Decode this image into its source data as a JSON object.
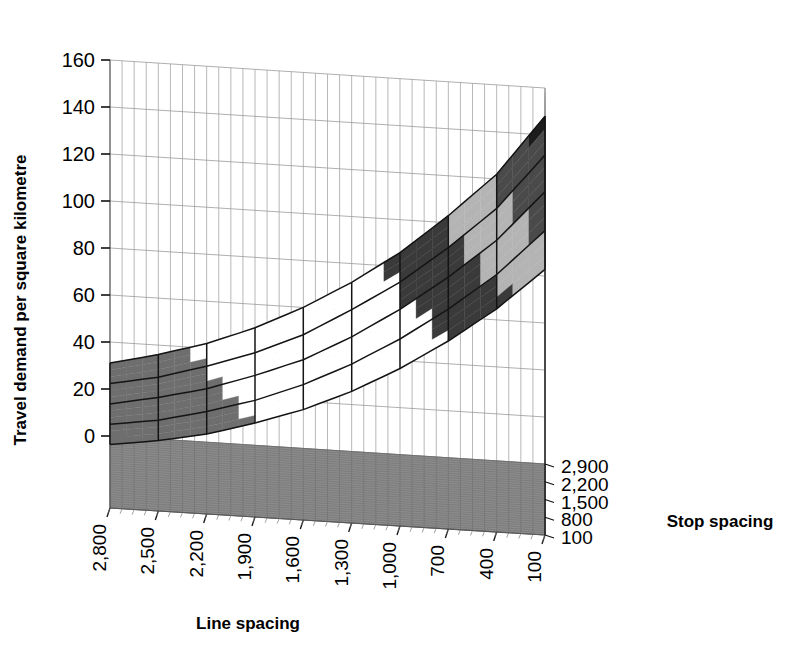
{
  "chart_data": {
    "type": "surface",
    "title": "",
    "xlabel": "Line spacing",
    "zlabel": "Stop spacing",
    "ylabel": "Travel demand per square kilometre",
    "x_categories": [
      "2,800",
      "2,500",
      "2,200",
      "1,900",
      "1,600",
      "1,300",
      "1,000",
      "700",
      "400",
      "100"
    ],
    "z_categories": [
      "2,900",
      "2,200",
      "1,500",
      "800",
      "100"
    ],
    "y_ticks": [
      0,
      20,
      40,
      60,
      80,
      100,
      120,
      140,
      160
    ],
    "ylim": [
      0,
      160
    ],
    "grid": true,
    "legend": "none",
    "band_boundaries": [
      0,
      20,
      40,
      60,
      80,
      100,
      120,
      140,
      160
    ],
    "band_colors": [
      "#d8d8d8",
      "#6e6e6e",
      "#ffffff",
      "#ffffff",
      "#3a3a3a",
      "#b4b4b4",
      "#4a4a4a",
      "#1c1c1c"
    ],
    "series": [
      {
        "name": "2,900",
        "values": [
          31,
          36,
          42,
          50,
          60,
          72,
          86,
          103,
          122,
          148
        ]
      },
      {
        "name": "2,200",
        "values": [
          30,
          34,
          40,
          47,
          56,
          68,
          81,
          97,
          115,
          139
        ]
      },
      {
        "name": "1,500",
        "values": [
          29,
          33,
          38,
          45,
          53,
          64,
          77,
          92,
          109,
          131
        ]
      },
      {
        "name": "800",
        "values": [
          28,
          31,
          36,
          42,
          50,
          60,
          72,
          86,
          102,
          122
        ]
      },
      {
        "name": "100",
        "values": [
          27,
          30,
          34,
          40,
          47,
          56,
          67,
          80,
          95,
          113
        ]
      }
    ],
    "axis_colors": {
      "wall": "#ffffff",
      "wall_grid": "#9a9a9a",
      "floor": "#8c8c8c",
      "floor_grid": "#6a6a6a",
      "mesh": "#141414",
      "axis_line": "#555555"
    }
  }
}
